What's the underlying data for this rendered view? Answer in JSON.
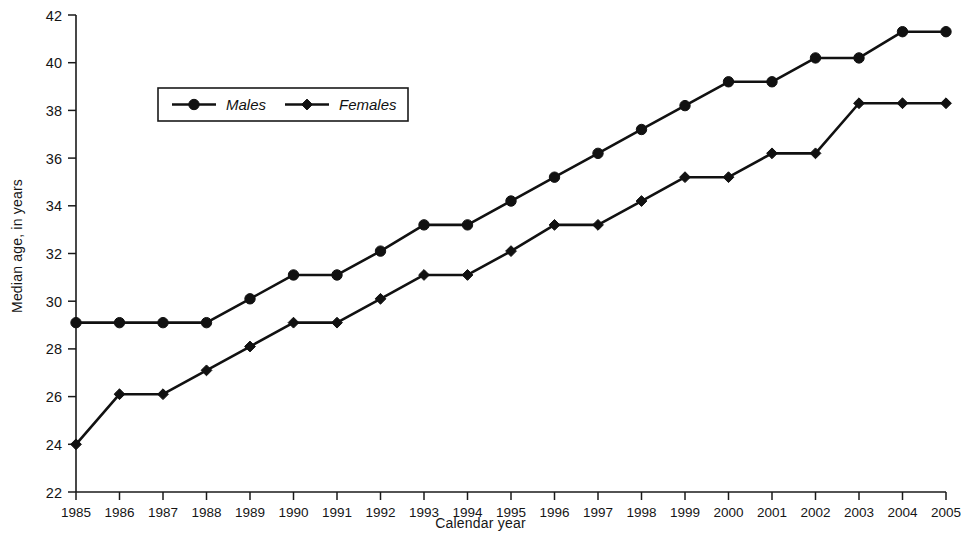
{
  "chart_data": {
    "type": "line",
    "title": "",
    "xlabel": "Calendar year",
    "ylabel": "Median age, in years",
    "categories": [
      "1985",
      "1986",
      "1987",
      "1988",
      "1989",
      "1990",
      "1991",
      "1992",
      "1993",
      "1994",
      "1995",
      "1996",
      "1997",
      "1998",
      "1999",
      "2000",
      "2001",
      "2002",
      "2003",
      "2004",
      "2005"
    ],
    "x": [
      1985,
      1986,
      1987,
      1988,
      1989,
      1990,
      1991,
      1992,
      1993,
      1994,
      1995,
      1996,
      1997,
      1998,
      1999,
      2000,
      2001,
      2002,
      2003,
      2004,
      2005
    ],
    "ylim": [
      22,
      42
    ],
    "ytick_labels": [
      "22",
      "24",
      "26",
      "28",
      "30",
      "32",
      "34",
      "36",
      "38",
      "40",
      "42"
    ],
    "yticks": [
      22,
      24,
      26,
      28,
      30,
      32,
      34,
      36,
      38,
      40,
      42
    ],
    "grid": false,
    "legend_position": "upper-left-inside",
    "series": [
      {
        "name": "Males",
        "marker": "circle",
        "color": "#111111",
        "values": [
          29.1,
          29.1,
          29.1,
          29.1,
          30.1,
          31.1,
          31.1,
          32.1,
          33.2,
          33.2,
          34.2,
          35.2,
          36.2,
          37.2,
          38.2,
          39.2,
          39.2,
          40.2,
          40.2,
          41.3,
          41.3
        ]
      },
      {
        "name": "Females",
        "marker": "diamond",
        "color": "#111111",
        "values": [
          24.0,
          26.1,
          26.1,
          27.1,
          28.1,
          29.1,
          29.1,
          30.1,
          31.1,
          31.1,
          32.1,
          33.2,
          33.2,
          34.2,
          35.2,
          35.2,
          36.2,
          36.2,
          38.3,
          38.3,
          38.3
        ]
      }
    ]
  },
  "legend": {
    "entries": [
      {
        "label": "Males"
      },
      {
        "label": "Females"
      }
    ]
  }
}
